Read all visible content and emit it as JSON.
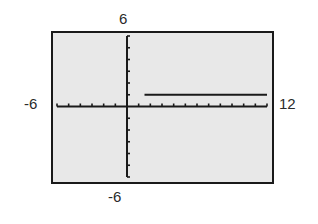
{
  "window": {
    "xmin": "-6",
    "xmax": "12",
    "ymin": "-6",
    "ymax": "6"
  },
  "chart_data": {
    "type": "line",
    "title": "",
    "xlabel": "",
    "ylabel": "",
    "xlim": [
      -6,
      12
    ],
    "ylim": [
      -6,
      6
    ],
    "xscale": 1,
    "yscale": 1,
    "grid": false,
    "series": [
      {
        "name": "graph",
        "x": [
          1.5,
          12
        ],
        "y": [
          1,
          1
        ]
      }
    ],
    "colors": {
      "screen_bg": "#e8e8e8",
      "frame": "#1a1a1a",
      "axis": "#1a1a1a",
      "curve": "#1a1a1a"
    }
  }
}
